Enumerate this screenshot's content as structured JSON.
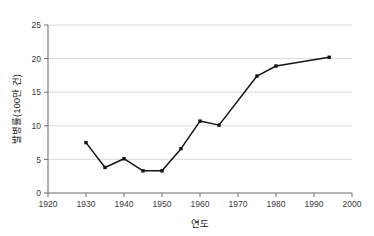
{
  "chart_data": {
    "type": "line",
    "title": "",
    "xlabel": "연도",
    "ylabel": "발병률(100만 건)",
    "xlim": [
      1920,
      2000
    ],
    "ylim": [
      0,
      25
    ],
    "grid": true,
    "legend": "none",
    "x_ticks": [
      "1920",
      "1930",
      "1940",
      "1950",
      "1960",
      "1970",
      "1980",
      "1990",
      "2000"
    ],
    "x_tick_values": [
      1920,
      1930,
      1940,
      1950,
      1960,
      1970,
      1980,
      1990,
      2000
    ],
    "y_ticks": [
      "0",
      "5",
      "10",
      "15",
      "20",
      "25"
    ],
    "y_tick_values": [
      0,
      5,
      10,
      15,
      20,
      25
    ],
    "series": [
      {
        "name": "발병률",
        "marker": "filled-square",
        "color": "#141414",
        "x": [
          1930,
          1935,
          1940,
          1945,
          1950,
          1955,
          1960,
          1965,
          1975,
          1980,
          1994
        ],
        "values": [
          7.5,
          3.8,
          5.1,
          3.3,
          3.3,
          6.6,
          10.7,
          10.1,
          17.4,
          18.9,
          20.2
        ]
      }
    ]
  }
}
